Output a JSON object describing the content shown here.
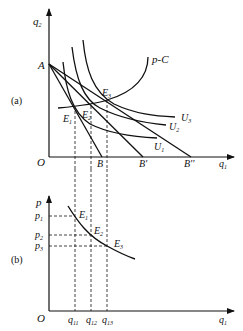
{
  "panel_a": {
    "label": "(a)",
    "y_axis_label": "q",
    "y_axis_sub": "2",
    "x_axis_label": "q",
    "x_axis_sub": "1",
    "origin": "O",
    "point_A": "A",
    "budget_intercepts": [
      "B",
      "B'",
      "B''"
    ],
    "pcc_label": "p-C",
    "indifference_curves": [
      {
        "name": "U",
        "sub": "1"
      },
      {
        "name": "U",
        "sub": "2"
      },
      {
        "name": "U",
        "sub": "3"
      }
    ],
    "equilibria": [
      {
        "name": "E",
        "sub": "1"
      },
      {
        "name": "E",
        "sub": "2"
      },
      {
        "name": "E",
        "sub": "3"
      }
    ]
  },
  "panel_b": {
    "label": "(b)",
    "y_axis_label": "p",
    "x_axis_label": "q",
    "x_axis_sub": "1",
    "origin": "O",
    "prices": [
      {
        "name": "p",
        "sub": "1"
      },
      {
        "name": "p",
        "sub": "2"
      },
      {
        "name": "p",
        "sub": "3"
      }
    ],
    "quantities": [
      {
        "name": "q",
        "sub": "11"
      },
      {
        "name": "q",
        "sub": "12"
      },
      {
        "name": "q",
        "sub": "13"
      }
    ],
    "points": [
      {
        "name": "E",
        "sub": "1"
      },
      {
        "name": "E",
        "sub": "2"
      },
      {
        "name": "E",
        "sub": "3"
      }
    ]
  },
  "colors": {
    "line": "#111111",
    "background": "#ffffff"
  }
}
